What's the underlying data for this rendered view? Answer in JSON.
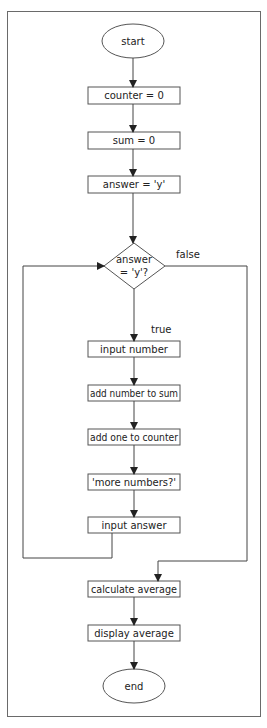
{
  "diagram": {
    "type": "flowchart",
    "colors": {
      "stroke": "#555555",
      "frame": "#6a6a6a",
      "text": "#222222",
      "background": "#ffffff"
    },
    "nodes": [
      {
        "id": "start",
        "shape": "ellipse",
        "label": "start"
      },
      {
        "id": "counter_init",
        "shape": "process",
        "label": "counter = 0"
      },
      {
        "id": "sum_init",
        "shape": "process",
        "label": "sum = 0"
      },
      {
        "id": "answer_init",
        "shape": "process",
        "label": "answer = 'y'"
      },
      {
        "id": "decision",
        "shape": "diamond",
        "label_line1": "answer",
        "label_line2": "= 'y'?"
      },
      {
        "id": "input_number",
        "shape": "process",
        "label": "input number"
      },
      {
        "id": "add_sum",
        "shape": "process",
        "label": "add number to sum"
      },
      {
        "id": "add_counter",
        "shape": "process",
        "label": "add one to counter"
      },
      {
        "id": "prompt",
        "shape": "process",
        "label": "'more numbers?'"
      },
      {
        "id": "input_answer",
        "shape": "process",
        "label": "input answer"
      },
      {
        "id": "calc_avg",
        "shape": "process",
        "label": "calculate average"
      },
      {
        "id": "display_avg",
        "shape": "process",
        "label": "display average"
      },
      {
        "id": "end",
        "shape": "ellipse",
        "label": "end"
      }
    ],
    "edges": [
      {
        "from": "start",
        "to": "counter_init"
      },
      {
        "from": "counter_init",
        "to": "sum_init"
      },
      {
        "from": "sum_init",
        "to": "answer_init"
      },
      {
        "from": "answer_init",
        "to": "decision"
      },
      {
        "from": "decision",
        "to": "input_number",
        "label": "true"
      },
      {
        "from": "decision",
        "to": "calc_avg",
        "label": "false"
      },
      {
        "from": "input_number",
        "to": "add_sum"
      },
      {
        "from": "add_sum",
        "to": "add_counter"
      },
      {
        "from": "add_counter",
        "to": "prompt"
      },
      {
        "from": "prompt",
        "to": "input_answer"
      },
      {
        "from": "input_answer",
        "to": "decision"
      },
      {
        "from": "calc_avg",
        "to": "display_avg"
      },
      {
        "from": "display_avg",
        "to": "end"
      }
    ],
    "edge_labels": {
      "true": "true",
      "false": "false"
    }
  }
}
